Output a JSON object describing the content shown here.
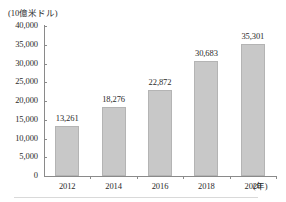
{
  "chart_data": {
    "type": "bar",
    "title": "",
    "subtitle": "",
    "unit_label": "(10億米ドル)",
    "xlabel": "(年)",
    "ylabel": "",
    "categories": [
      "2012",
      "2014",
      "2016",
      "2018",
      "2020"
    ],
    "values": [
      13261,
      18276,
      22872,
      30683,
      35301
    ],
    "value_labels": [
      "13,261",
      "18,276",
      "22,872",
      "30,683",
      "35,301"
    ],
    "ylim": [
      0,
      40000
    ],
    "ytick_values": [
      0,
      5000,
      10000,
      15000,
      20000,
      25000,
      30000,
      35000,
      40000
    ],
    "ytick_labels": [
      "0",
      "5,000",
      "10,000",
      "15,000",
      "20,000",
      "25,000",
      "30,000",
      "35,000",
      "40,000"
    ],
    "grid": false,
    "legend": null,
    "legend_position": "none",
    "bar_color": "#c8c8c8",
    "bar_border_color": "#b4b4b4",
    "axis_color": "#8a8a8a",
    "text_color": "#2b2b2b"
  }
}
